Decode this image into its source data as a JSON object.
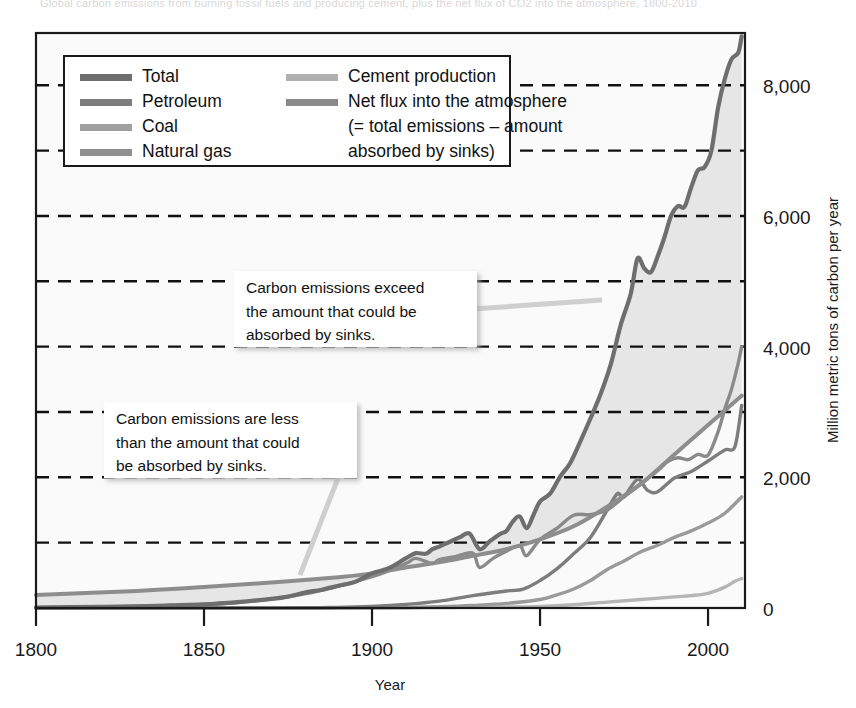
{
  "figure": {
    "top_caption": "Global carbon emissions from burning fossil fuels and producing cement, plus the net flux of CO2 into the atmosphere, 1800-2010",
    "background": "#ffffff",
    "frame_color": "#1a1a1a",
    "gridline_color": "#111111"
  },
  "chart_data": {
    "type": "line",
    "title": "",
    "xlabel": "Year",
    "ylabel": "Million metric tons of carbon per year",
    "xlim": [
      1800,
      2011
    ],
    "ylim": [
      0,
      8800
    ],
    "xticks": [
      1800,
      1850,
      1900,
      1950,
      2000
    ],
    "xtick_labels": [
      "1800",
      "1850",
      "1900",
      "1950",
      "2000"
    ],
    "yticks": [
      0,
      2000,
      4000,
      6000,
      8000
    ],
    "ytick_labels": [
      "0",
      "2,000",
      "4,000",
      "6,000",
      "8,000"
    ],
    "minor_gridlines": [
      1000,
      3000,
      5000,
      7000
    ],
    "grid": "dashed horizontal gridlines every 1000",
    "legend_position": "top-left inside plot",
    "series": [
      {
        "name": "Total",
        "color": "#6e6e6e",
        "width": 4.2,
        "x": [
          1800,
          1810,
          1820,
          1830,
          1840,
          1850,
          1860,
          1870,
          1875,
          1880,
          1885,
          1890,
          1895,
          1900,
          1905,
          1910,
          1913,
          1916,
          1918,
          1920,
          1923,
          1926,
          1929,
          1932,
          1935,
          1938,
          1940,
          1942,
          1944,
          1946,
          1948,
          1950,
          1953,
          1956,
          1959,
          1962,
          1965,
          1968,
          1971,
          1974,
          1977,
          1979,
          1981,
          1983,
          1985,
          1987,
          1989,
          1991,
          1993,
          1995,
          1997,
          1999,
          2001,
          2003,
          2005,
          2007,
          2009,
          2010
        ],
        "y": [
          8,
          12,
          18,
          27,
          40,
          55,
          90,
          140,
          175,
          235,
          280,
          340,
          400,
          530,
          610,
          760,
          840,
          830,
          900,
          940,
          1010,
          1080,
          1140,
          900,
          1020,
          1130,
          1180,
          1330,
          1400,
          1220,
          1420,
          1630,
          1750,
          2010,
          2220,
          2550,
          2900,
          3270,
          3720,
          4330,
          4810,
          5350,
          5200,
          5140,
          5380,
          5670,
          6000,
          6150,
          6140,
          6440,
          6700,
          6750,
          7000,
          7660,
          8100,
          8400,
          8500,
          8750
        ]
      },
      {
        "name": "Petroleum",
        "color": "#7d7d7d",
        "width": 3.4,
        "x": [
          1800,
          1870,
          1890,
          1900,
          1910,
          1920,
          1930,
          1940,
          1945,
          1950,
          1955,
          1960,
          1965,
          1970,
          1973,
          1975,
          1979,
          1982,
          1985,
          1990,
          1995,
          2000,
          2005,
          2008,
          2010
        ],
        "y": [
          0,
          2,
          10,
          25,
          55,
          105,
          190,
          260,
          290,
          420,
          600,
          830,
          1080,
          1500,
          1750,
          1700,
          1970,
          1800,
          1780,
          1990,
          2090,
          2250,
          2420,
          2470,
          3100
        ]
      },
      {
        "name": "Coal",
        "color": "#8a8a8a",
        "width": 3.4,
        "x": [
          1800,
          1820,
          1840,
          1860,
          1880,
          1900,
          1910,
          1913,
          1918,
          1920,
          1925,
          1930,
          1932,
          1936,
          1940,
          1944,
          1946,
          1950,
          1955,
          1960,
          1965,
          1970,
          1975,
          1980,
          1985,
          1988,
          1991,
          1994,
          1997,
          2000,
          2003,
          2005,
          2007,
          2009,
          2010
        ],
        "y": [
          8,
          18,
          38,
          85,
          215,
          480,
          680,
          760,
          680,
          740,
          790,
          840,
          620,
          760,
          870,
          950,
          800,
          1050,
          1220,
          1420,
          1430,
          1500,
          1700,
          1900,
          2100,
          2240,
          2300,
          2270,
          2350,
          2340,
          2700,
          3050,
          3350,
          3750,
          4000
        ]
      },
      {
        "name": "Natural gas",
        "color": "#9a9a9a",
        "width": 3.4,
        "x": [
          1800,
          1890,
          1900,
          1910,
          1920,
          1930,
          1940,
          1950,
          1955,
          1960,
          1965,
          1970,
          1975,
          1980,
          1985,
          1990,
          1995,
          2000,
          2005,
          2010
        ],
        "y": [
          0,
          1,
          3,
          8,
          20,
          40,
          70,
          130,
          200,
          290,
          420,
          590,
          720,
          860,
          960,
          1080,
          1180,
          1300,
          1450,
          1700
        ]
      },
      {
        "name": "Cement production",
        "color": "#b5b5b5",
        "width": 3.4,
        "x": [
          1800,
          1900,
          1920,
          1940,
          1950,
          1960,
          1970,
          1980,
          1990,
          1995,
          2000,
          2005,
          2008,
          2010
        ],
        "y": [
          0,
          3,
          8,
          15,
          25,
          50,
          90,
          130,
          170,
          190,
          225,
          320,
          410,
          450
        ]
      },
      {
        "name": "Net flux into the atmosphere",
        "color": "#8d8d8d",
        "width": 4.0,
        "x": [
          1800,
          1830,
          1850,
          1870,
          1890,
          1900,
          1910,
          1920,
          1930,
          1940,
          1950,
          1960,
          1970,
          1980,
          1990,
          2000,
          2010
        ],
        "y": [
          200,
          260,
          320,
          390,
          470,
          530,
          620,
          700,
          800,
          900,
          1050,
          1250,
          1550,
          1900,
          2350,
          2800,
          3250
        ]
      }
    ],
    "fill_between": {
      "description": "light shading between Total and Net flux curves",
      "color": "#e6e6e6"
    },
    "annotations": [
      {
        "id": "callout-exceed",
        "text": "Carbon emissions exceed the amount that could be absorbed by sinks.",
        "lines": [
          "Carbon emissions exceed",
          "the amount that could be",
          "absorbed by sinks."
        ],
        "box": {
          "x": 234,
          "y": 271,
          "w": 243,
          "h": 76
        },
        "leader_to": {
          "x": 602,
          "y": 300
        }
      },
      {
        "id": "callout-less",
        "text": "Carbon emissions are less than the amount that could be absorbed by sinks.",
        "lines": [
          "Carbon emissions are less",
          "than the amount that could",
          "be absorbed by sinks."
        ],
        "box": {
          "x": 104,
          "y": 402,
          "w": 253,
          "h": 76
        },
        "leader_to": {
          "x": 300,
          "y": 575
        }
      }
    ]
  },
  "legend": {
    "box": {
      "x": 64,
      "y": 56,
      "w": 446,
      "h": 110
    },
    "columns": [
      [
        {
          "label": "Total",
          "color": "#6e6e6e"
        },
        {
          "label": "Petroleum",
          "color": "#7d7d7d"
        },
        {
          "label": "Coal",
          "color": "#a0a0a0"
        },
        {
          "label": "Natural gas",
          "color": "#909090"
        }
      ],
      [
        {
          "label": "Cement production",
          "color": "#b0b0b0"
        },
        {
          "label": "Net flux into the atmosphere",
          "color": "#8a8a8a"
        },
        {
          "label": "(= total emissions – amount",
          "color": null
        },
        {
          "label": "absorbed by sinks)",
          "color": null
        }
      ]
    ]
  }
}
